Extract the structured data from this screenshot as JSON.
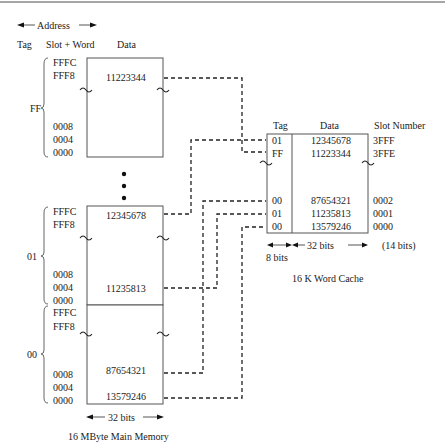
{
  "header": {
    "address_label": "Address",
    "col_tag": "Tag",
    "col_slot_word": "Slot + Word",
    "col_data": "Data"
  },
  "main_memory": {
    "title": "16 MByte Main Memory",
    "width_label": "32 bits",
    "blocks": [
      {
        "tag": "FF",
        "addresses_top": [
          "FFFC",
          "FFF8"
        ],
        "addresses_bottom": [
          "0008",
          "0004",
          "0000"
        ],
        "data": [
          {
            "address": "FFF8",
            "value": "11223344"
          }
        ]
      },
      {
        "tag": "01",
        "addresses_top": [
          "FFFC",
          "FFF8"
        ],
        "addresses_bottom": [
          "0008",
          "0004",
          "0000"
        ],
        "data": [
          {
            "address": "FFFC",
            "value": "12345678"
          },
          {
            "address": "0004",
            "value": "11235813"
          }
        ]
      },
      {
        "tag": "00",
        "addresses_top": [
          "FFFC",
          "FFF8"
        ],
        "addresses_bottom": [
          "0008",
          "0004",
          "0000"
        ],
        "data": [
          {
            "address": "0008",
            "value": "87654321"
          },
          {
            "address": "0000",
            "value": "13579246"
          }
        ]
      }
    ]
  },
  "cache": {
    "title": "16 K Word Cache",
    "col_tag": "Tag",
    "col_data": "Data",
    "col_slot": "Slot Number",
    "tag_width_label": "8 bits",
    "data_width_label": "32 bits",
    "slot_width_label": "(14 bits)",
    "rows": [
      {
        "tag": "01",
        "data": "12345678",
        "slot": "3FFF"
      },
      {
        "tag": "FF",
        "data": "11223344",
        "slot": "3FFE"
      },
      {
        "tag": "00",
        "data": "87654321",
        "slot": "0002"
      },
      {
        "tag": "01",
        "data": "11235813",
        "slot": "0001"
      },
      {
        "tag": "00",
        "data": "13579246",
        "slot": "0000"
      }
    ]
  }
}
